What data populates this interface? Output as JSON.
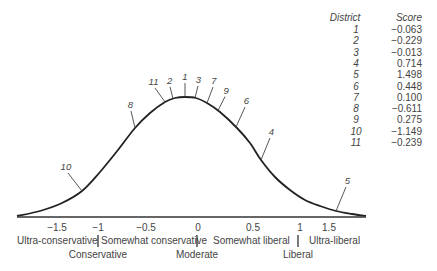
{
  "chart_data": {
    "type": "line",
    "title": "",
    "xlabel": "",
    "ylabel": "",
    "xlim": [
      -1.9,
      1.9
    ],
    "x_ticks": [
      {
        "value": -1.5,
        "label": "−1.5"
      },
      {
        "value": -1,
        "label": "−1"
      },
      {
        "value": -0.5,
        "label": "−0.5"
      },
      {
        "value": 0,
        "label": "0"
      },
      {
        "value": 0.5,
        "label": "0.5"
      },
      {
        "value": 1,
        "label": "1"
      },
      {
        "value": 1.5,
        "label": "1.5"
      }
    ],
    "grid": false,
    "curve": "normal distribution (bell curve), peak near -0.1",
    "categories_row1": [
      {
        "label": "Ultra-conservative",
        "from": -1.9,
        "to": -1
      },
      {
        "label": "Somewhat conservative",
        "from": -1,
        "to": 0
      },
      {
        "label": "Somewhat liberal",
        "from": 0,
        "to": 1
      },
      {
        "label": "Ultra-liberal",
        "from": 1,
        "to": 1.9
      }
    ],
    "categories_row2": [
      {
        "label": "Conservative",
        "at": -1
      },
      {
        "label": "Moderate",
        "at": 0
      },
      {
        "label": "Liberal",
        "at": 1
      }
    ],
    "districts": [
      {
        "district": "1",
        "score": -0.063,
        "score_label": "−0.063"
      },
      {
        "district": "2",
        "score": -0.229,
        "score_label": "−0.229"
      },
      {
        "district": "3",
        "score": -0.013,
        "score_label": "−0.013"
      },
      {
        "district": "4",
        "score": 0.714,
        "score_label": "0.714"
      },
      {
        "district": "5",
        "score": 1.498,
        "score_label": "1.498"
      },
      {
        "district": "6",
        "score": 0.448,
        "score_label": "0.448"
      },
      {
        "district": "7",
        "score": 0.1,
        "score_label": "0.100"
      },
      {
        "district": "8",
        "score": -0.611,
        "score_label": "−0.611"
      },
      {
        "district": "9",
        "score": 0.275,
        "score_label": "0.275"
      },
      {
        "district": "10",
        "score": -1.149,
        "score_label": "−1.149"
      },
      {
        "district": "11",
        "score": -0.239,
        "score_label": "−0.239"
      }
    ],
    "table": {
      "headers": {
        "district": "District",
        "score": "Score"
      }
    }
  }
}
